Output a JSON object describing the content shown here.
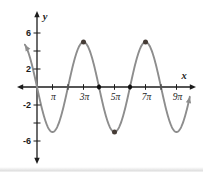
{
  "chart_data": {
    "type": "line",
    "title": "",
    "xlabel": "x",
    "ylabel": "y",
    "x_axis": {
      "ticks_in_pi": [
        1,
        2,
        3,
        4,
        5,
        6,
        7,
        8,
        9
      ],
      "labeled_ticks_in_pi": [
        1,
        3,
        5,
        7,
        9
      ],
      "tick_labels": [
        "π",
        "3π",
        "5π",
        "7π",
        "9π"
      ]
    },
    "y_axis": {
      "ticks": [
        6,
        4,
        2,
        -2,
        -4,
        -6
      ],
      "labeled_ticks": [
        6,
        2,
        -2,
        -6
      ],
      "tick_labels": [
        "6",
        "2",
        "-2",
        "-6"
      ]
    },
    "series": [
      {
        "name": "sine-curve",
        "model": "y = a·sin(b·x)",
        "a": -5,
        "b": 0.5,
        "amplitude": 5,
        "period_in_pi": 4,
        "x_start_in_pi": -0.78,
        "x_end_in_pi": 9.86,
        "key_points_in_pi": [
          [
            0,
            0
          ],
          [
            1,
            -5
          ],
          [
            2,
            0
          ],
          [
            3,
            5
          ],
          [
            4,
            0
          ],
          [
            5,
            -5
          ],
          [
            6,
            0
          ],
          [
            7,
            5
          ],
          [
            8,
            0
          ],
          [
            9,
            -5
          ]
        ]
      }
    ],
    "marked_points": {
      "on_axis_in_pi": [
        [
          4,
          0
        ],
        [
          6,
          0
        ]
      ],
      "extrema_in_pi": [
        [
          3,
          5
        ],
        [
          5,
          -5
        ],
        [
          7,
          5
        ]
      ]
    },
    "colors": {
      "curve": "#8d8d8d",
      "axis": "#1c1c1c",
      "axis_point": "#101010",
      "extremum_point": "#453c36",
      "label": "#1c1c1c",
      "background": "#ffffff"
    },
    "layout": {
      "grid": false,
      "legend": false,
      "origin_px": [
        37,
        87
      ],
      "px_per_pi": 15.5,
      "px_per_unit_y": 9,
      "x_axis_line_px": [
        21,
        192
      ],
      "y_axis_line_px": [
        15,
        160
      ],
      "x_arrow_tips_px": [
        17,
        196
      ],
      "y_arrow_tips_px": [
        11,
        164
      ]
    }
  }
}
